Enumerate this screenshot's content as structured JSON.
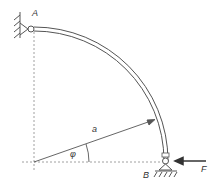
{
  "diagram": {
    "title": "",
    "labels": {
      "point_a": "A",
      "point_b": "B",
      "radius": "a",
      "angle": "φ",
      "force": "F"
    },
    "elements": {
      "beam": "quarter-circle curved beam",
      "support_a": "pin support attached to wall",
      "support_b": "roller/pin support on ground",
      "force_direction": "horizontal, pointing left at B"
    },
    "colors": {
      "line": "#555555",
      "dashed": "#888888",
      "text": "#333333"
    }
  }
}
